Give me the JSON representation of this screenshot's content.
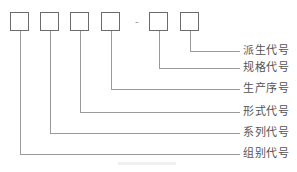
{
  "diagram": {
    "separator": "-",
    "boxes": [
      {
        "id": "group"
      },
      {
        "id": "series"
      },
      {
        "id": "form"
      },
      {
        "id": "sequence"
      },
      {
        "id": "spec"
      },
      {
        "id": "derived"
      }
    ],
    "labels": {
      "derived": "派生代号",
      "spec": "规格代号",
      "sequence": "生产序号",
      "form": "形式代号",
      "series": "系列代号",
      "group": "组别代号"
    },
    "colors": {
      "box_border": "#6b6b6b",
      "line": "#9a9a9a",
      "text": "#555555"
    }
  }
}
